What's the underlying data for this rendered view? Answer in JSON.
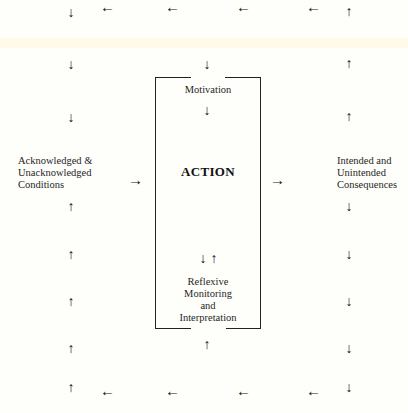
{
  "diagram": {
    "center_box": {
      "title": "ACTION",
      "top_label": "Motivation",
      "bottom_label_lines": [
        "Reflexive",
        "Monitoring",
        "and",
        "Interpretation"
      ]
    },
    "left_node": {
      "lines": [
        "Acknowledged &",
        "Unacknowledged",
        "Conditions"
      ]
    },
    "right_node": {
      "lines": [
        "Intended and",
        "Unintended",
        "Consequences"
      ]
    },
    "glyphs": {
      "down": "↓",
      "up": "↑",
      "left": "←",
      "right": "→"
    },
    "flow": {
      "top_row": "arrows pointing left from right column to left column",
      "left_column": "arrows pointing down (top) and up (bottom) toward conditions",
      "center": "conditions → ACTION → consequences",
      "right_column": "arrows up above consequences, down below",
      "bottom_row": "arrows pointing left"
    },
    "colors": {
      "background": "#fefefb",
      "ink": "#111111"
    }
  }
}
